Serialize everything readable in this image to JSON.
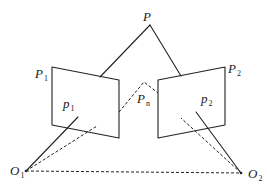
{
  "diagram": {
    "type": "epipolar-geometry",
    "colors": {
      "stroke": "#222222",
      "background": "#ffffff"
    },
    "labels": {
      "P": {
        "main": "P",
        "sub": ""
      },
      "P1": {
        "main": "P",
        "sub": "1"
      },
      "P2": {
        "main": "P",
        "sub": "2"
      },
      "p1": {
        "main": "p",
        "sub": "1"
      },
      "p2": {
        "main": "p",
        "sub": "2"
      },
      "Pn": {
        "main": "P",
        "sub": "n"
      },
      "O1": {
        "main": "O",
        "sub": "1"
      },
      "O2": {
        "main": "O",
        "sub": "2"
      }
    },
    "points": {
      "P": [
        150,
        25
      ],
      "O1": [
        26,
        171
      ],
      "O2": [
        241,
        173
      ],
      "Pn": [
        144,
        82
      ]
    },
    "planes": [
      {
        "name": "P1",
        "corners": [
          [
            52,
            67
          ],
          [
            119,
            80
          ],
          [
            119,
            138
          ],
          [
            52,
            125
          ]
        ]
      },
      {
        "name": "P2",
        "corners": [
          [
            158,
            80
          ],
          [
            225,
            67
          ],
          [
            225,
            125
          ],
          [
            158,
            138
          ]
        ]
      }
    ]
  }
}
